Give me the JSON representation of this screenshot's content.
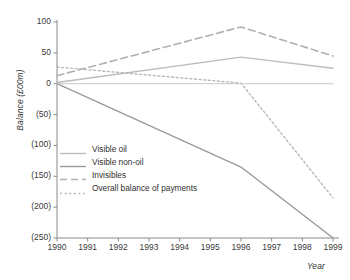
{
  "chart_data": {
    "type": "line",
    "title": "",
    "xlabel": "Year",
    "ylabel": "Balance (£00m)",
    "x": [
      1990,
      1991,
      1992,
      1993,
      1994,
      1995,
      1996,
      1997,
      1998,
      1999
    ],
    "xtick_labels": [
      "1990",
      "1991",
      "1992",
      "1993",
      "1994",
      "1995",
      "1996",
      "1997",
      "1998",
      "1999"
    ],
    "ytick_values": [
      100,
      50,
      0,
      -50,
      -100,
      -150,
      -200,
      -250
    ],
    "ytick_labels": [
      "100",
      "50",
      "0",
      "(50)",
      "(100)",
      "(150)",
      "(200)",
      "(250)"
    ],
    "ylim": [
      -250,
      100
    ],
    "xlim": [
      1990,
      1999
    ],
    "grid": false,
    "legend_position": "inside-lower-left",
    "series": [
      {
        "name": "Visible oil",
        "style": "solid",
        "color": "#bcbcbc",
        "width": 1.4,
        "x": [
          1990,
          1996,
          1999
        ],
        "values": [
          2,
          43,
          25
        ]
      },
      {
        "name": "Visible non-oil",
        "style": "solid",
        "color": "#9a9a9a",
        "width": 1.4,
        "x": [
          1990,
          1996,
          1999
        ],
        "values": [
          0,
          -135,
          -250
        ]
      },
      {
        "name": "Invisibles",
        "style": "dashed",
        "color": "#b0b0b0",
        "width": 1.6,
        "x": [
          1990,
          1996,
          1999
        ],
        "values": [
          13,
          92,
          45
        ]
      },
      {
        "name": "Overall balance of payments",
        "style": "dotted",
        "color": "#b8b8b8",
        "width": 1.4,
        "x": [
          1990,
          1996,
          1999
        ],
        "values": [
          27,
          1,
          -185
        ]
      },
      {
        "name": "Zero baseline",
        "style": "solid",
        "color": "#c8c8c8",
        "width": 1.0,
        "x": [
          1990,
          1999
        ],
        "values": [
          0,
          0
        ]
      }
    ],
    "axis_color": "#8a8a8a"
  },
  "legend": {
    "items": [
      {
        "label": "Visible oil"
      },
      {
        "label": "Visible non-oil"
      },
      {
        "label": "Invisibles"
      },
      {
        "label": "Overall balance of payments"
      }
    ]
  }
}
